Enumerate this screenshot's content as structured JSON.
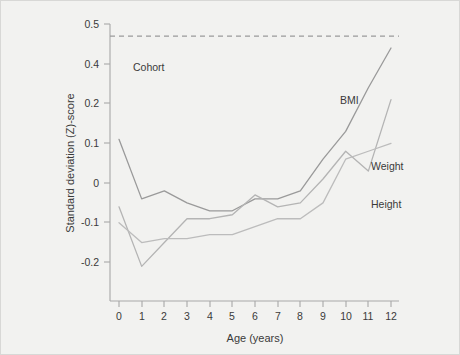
{
  "chart_data": {
    "type": "line",
    "title": "",
    "xlabel": "Age (years)",
    "ylabel": "Standard deviation (Z)-score",
    "x": [
      0,
      1,
      2,
      3,
      4,
      5,
      6,
      7,
      8,
      9,
      10,
      11,
      12
    ],
    "xlim": [
      0,
      12
    ],
    "ylim": [
      -0.2,
      0.5
    ],
    "grid": false,
    "legend_position": "inline-right",
    "xticks": [
      "0",
      "1",
      "2",
      "3",
      "4",
      "5",
      "6",
      "7",
      "8",
      "9",
      "10",
      "11",
      "12"
    ],
    "yticks": [
      "0.5",
      "0.4",
      "0.2",
      "0.1",
      "0",
      "-0.1",
      "-0.2"
    ],
    "ytick_values": [
      0.5,
      0.4,
      0.3,
      0.2,
      0.1,
      0.0,
      -0.1
    ],
    "series": [
      {
        "name": "BMI",
        "color": "#9a9a9a",
        "values": [
          0.11,
          -0.04,
          -0.02,
          -0.05,
          -0.07,
          -0.07,
          -0.04,
          -0.04,
          -0.02,
          0.06,
          0.13,
          0.24,
          0.34
        ]
      },
      {
        "name": "Weight",
        "color": "#b4b4b4",
        "values": [
          -0.06,
          -0.21,
          -0.15,
          -0.09,
          -0.09,
          -0.08,
          -0.03,
          -0.06,
          -0.05,
          0.01,
          0.08,
          0.03,
          0.21
        ]
      },
      {
        "name": "Height",
        "color": "#bcbcbc",
        "values": [
          -0.1,
          -0.15,
          -0.14,
          -0.14,
          -0.13,
          -0.13,
          -0.11,
          -0.09,
          -0.09,
          -0.05,
          0.06,
          0.08,
          0.1
        ]
      }
    ],
    "reference_line": {
      "label": "Cohort",
      "value": 0.37,
      "style": "dashed",
      "color": "#9a9a9a"
    },
    "annotations": [
      {
        "name": "BMI",
        "label": "BMI"
      },
      {
        "name": "Weight",
        "label": "Weight"
      },
      {
        "name": "Height",
        "label": "Height"
      },
      {
        "name": "Cohort",
        "label": "Cohort"
      }
    ]
  },
  "axes": {
    "frame_color": "#a8a8a8",
    "text_color": "#3a3a3a"
  },
  "background": {
    "figure": "#f2f2f0",
    "plot": "#f2f2f0"
  }
}
